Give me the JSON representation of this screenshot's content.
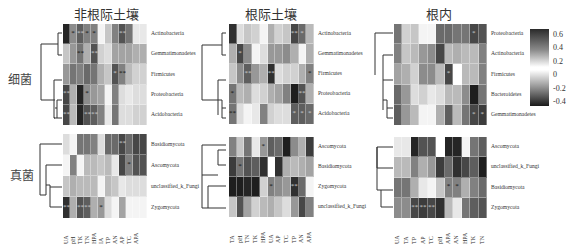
{
  "groups": {
    "bacteria": "细菌",
    "fungi": "真菌"
  },
  "colorbar": {
    "ticks": [
      "0.6",
      "0.4",
      "0.2",
      "0",
      "-0.2",
      "-0.4"
    ],
    "upper_range": [
      0.2,
      0.6
    ],
    "lower_range": [
      -0.4,
      0
    ],
    "colors": {
      "dark": "#1a1a1a",
      "light": "#ffffff"
    }
  },
  "chart_data": {
    "type": "heatmap",
    "title": "",
    "value_scale": "grayscale darkness 0 (white) to 1 (black); legend ranges -0.4..0.6",
    "panels": [
      {
        "title": "非根际土壤",
        "columns": [
          "UA",
          "pH",
          "TK",
          "TN",
          "HPA",
          "IA",
          "TP",
          "AN",
          "AP",
          "TC",
          "APA",
          ""
        ],
        "bacteria_rows": [
          "Actinobacteria",
          "Gemmatimonadetes",
          "Firmicutes",
          "Proteobacteria",
          "Acidobacteria"
        ],
        "bacteria_values": [
          [
            0.95,
            0.5,
            0.7,
            0.55,
            0.55,
            0.05,
            0.25,
            0.55,
            0.75,
            0.6,
            0.1,
            0.1
          ],
          [
            0.25,
            0.45,
            0.6,
            0.35,
            0.75,
            0.2,
            0.15,
            0.4,
            0.4,
            0.4,
            0.35,
            0.35
          ],
          [
            0.45,
            0.6,
            0.55,
            0.65,
            0.6,
            0.35,
            0.25,
            0.75,
            0.55,
            0.3,
            0.2,
            0.2
          ],
          [
            0.8,
            0.35,
            0.95,
            0.5,
            0.45,
            0.4,
            0.05,
            0.55,
            0.15,
            0.1,
            0.15,
            0.15
          ],
          [
            0.8,
            0.3,
            0.95,
            0.75,
            0.7,
            0.55,
            0.1,
            0.6,
            0.15,
            0.15,
            0.2,
            0.2
          ]
        ],
        "bacteria_sig": [
          [
            "",
            "*",
            "***",
            "*",
            "*",
            "",
            "",
            "",
            "**",
            "",
            "",
            ""
          ],
          [
            "",
            "",
            "**",
            "",
            "**",
            "",
            "",
            "",
            "",
            "",
            "",
            ""
          ],
          [
            "",
            "",
            "",
            "",
            "",
            "",
            "",
            "*",
            "**",
            "",
            "",
            ""
          ],
          [
            "**",
            "",
            "",
            "*",
            "",
            "",
            "",
            "",
            "",
            "",
            "",
            ""
          ],
          [
            "**",
            "",
            "",
            "**",
            "**",
            "",
            "",
            "",
            "",
            "",
            "",
            ""
          ]
        ],
        "fungi_rows": [
          "Basidiomycota",
          "Ascomycota",
          "unclassified_k_Fungi",
          "Zygomycota"
        ],
        "fungi_values": [
          [
            0.15,
            0.05,
            0.6,
            0.6,
            0.55,
            0.15,
            0.65,
            0.65,
            0.8,
            0.65,
            0.8,
            0.8
          ],
          [
            0.05,
            0.55,
            0.05,
            0.3,
            0.3,
            0.25,
            0.3,
            0.1,
            0.8,
            0.55,
            0.75,
            0.75
          ],
          [
            0.25,
            0.35,
            0.3,
            0.3,
            0.3,
            0.05,
            0.3,
            0.25,
            0.1,
            0.15,
            0.15,
            0.15
          ],
          [
            0.9,
            0.35,
            0.75,
            0.7,
            0.35,
            0.45,
            0.15,
            0.05,
            0.4,
            0.05,
            0.05,
            0.05
          ]
        ],
        "fungi_sig": [
          [
            "",
            "",
            "",
            "",
            "",
            "",
            "",
            "",
            "**",
            "",
            "",
            ""
          ],
          [
            "",
            "",
            "",
            "",
            "",
            "",
            "",
            "",
            "",
            "*",
            "",
            ""
          ],
          [
            "",
            "",
            "",
            "",
            "",
            "",
            "",
            "",
            "",
            "",
            "",
            ""
          ],
          [
            "**",
            "",
            "***",
            "***",
            "",
            "*",
            "",
            "",
            "",
            "",
            "",
            ""
          ]
        ]
      },
      {
        "title": "根际土壤",
        "columns": [
          "TA",
          "pH",
          "TN",
          "TK",
          "HPA",
          "UA",
          "AP",
          "TC",
          "TP",
          "AN",
          "APA"
        ],
        "bacteria_rows": [
          "Actinobacteria",
          "Gemmatimonadetes",
          "Firmicutes",
          "Proteobacteria",
          "Acidobacteria"
        ],
        "bacteria_values": [
          [
            0.9,
            0.15,
            0.25,
            0.2,
            0.05,
            0.35,
            0.2,
            0.25,
            0.8,
            0.65,
            0.3
          ],
          [
            0.35,
            0.8,
            0.5,
            0.05,
            0.15,
            0.45,
            0.45,
            0.5,
            0.35,
            0.05,
            0.35
          ],
          [
            0.25,
            0.5,
            0.7,
            0.45,
            0.35,
            0.9,
            0.15,
            0.2,
            0.2,
            0.35,
            0.55
          ],
          [
            0.6,
            0.3,
            0.35,
            0.15,
            0.2,
            0.35,
            0.4,
            0.55,
            0.98,
            0.75,
            0.35
          ],
          [
            0.6,
            0.15,
            0.05,
            0.1,
            0.55,
            0.2,
            0.15,
            0.15,
            0.7,
            0.7,
            0.65
          ]
        ],
        "bacteria_sig": [
          [
            "",
            "",
            "",
            "",
            "",
            "",
            "",
            "",
            "**",
            "*",
            ""
          ],
          [
            "",
            "*",
            "",
            "",
            "",
            "",
            "",
            "",
            "",
            "",
            ""
          ],
          [
            "",
            "",
            "**",
            "",
            "",
            "**",
            "",
            "",
            "",
            "",
            "*"
          ],
          [
            "*",
            "",
            "",
            "",
            "",
            "",
            "",
            "",
            "",
            "**",
            ""
          ],
          [
            "**",
            "",
            "",
            "",
            "",
            "",
            "",
            "",
            "*",
            "*",
            "*"
          ]
        ],
        "fungi_rows": [
          "Ascomycota",
          "Basidiomycota",
          "Zygomycota",
          "unclassified_k_Fungi"
        ],
        "fungi_values": [
          [
            0.55,
            0.25,
            0.6,
            0.1,
            0.45,
            0.7,
            0.65,
            0.98,
            0.5,
            0.35,
            0.85
          ],
          [
            0.85,
            0.6,
            0.75,
            0.7,
            0.9,
            0.0,
            0.9,
            0.35,
            0.3,
            0.35,
            0.4
          ],
          [
            0.98,
            0.98,
            0.95,
            0.98,
            0.2,
            0.55,
            0.5,
            0.45,
            0.9,
            0.65,
            0.05
          ],
          [
            0.25,
            0.75,
            0.4,
            0.2,
            0.3,
            0.35,
            0.25,
            0.15,
            0.45,
            0.8,
            0.55
          ]
        ],
        "fungi_sig": [
          [
            "",
            "",
            "",
            "",
            "*",
            "",
            "",
            "",
            "",
            "",
            ""
          ],
          [
            "",
            "*",
            "",
            "",
            "",
            "",
            "",
            "",
            "",
            "",
            ""
          ],
          [
            "",
            "",
            "",
            "",
            "",
            "*",
            "",
            "",
            "**",
            "",
            ""
          ],
          [
            "",
            "",
            "",
            "",
            "",
            "",
            "",
            "",
            "",
            "",
            ""
          ]
        ]
      },
      {
        "title": "根内",
        "columns": [
          "UA",
          "TA",
          "TP",
          "AP",
          "TC",
          "pH",
          "APA",
          "AN",
          "HPA",
          "TK",
          "TN"
        ],
        "bacteria_rows": [
          "Proteobacteria",
          "Actinobacteria",
          "Firmicutes",
          "Bacteroidetes",
          "Gemmatimonadetes"
        ],
        "bacteria_values": [
          [
            0.6,
            0.2,
            0.25,
            0.05,
            0.05,
            0.65,
            0.65,
            0.6,
            0.6,
            0.8,
            0.75
          ],
          [
            0.55,
            0.25,
            0.3,
            0.45,
            0.5,
            0.8,
            0.3,
            0.35,
            0.3,
            0.3,
            0.55
          ],
          [
            0.4,
            0.35,
            0.2,
            0.5,
            0.5,
            0.3,
            0.8,
            0.0,
            0.3,
            0.3,
            0.55
          ],
          [
            0.65,
            0.45,
            0.15,
            0.2,
            0.1,
            0.15,
            0.3,
            0.3,
            0.5,
            0.98,
            0.6
          ],
          [
            0.7,
            0.45,
            0.3,
            0.05,
            0.05,
            0.35,
            0.7,
            0.3,
            0.6,
            0.8,
            0.85
          ]
        ],
        "bacteria_sig": [
          [
            "",
            "",
            "",
            "",
            "",
            "",
            "",
            "",
            "",
            "*",
            ""
          ],
          [
            "",
            "",
            "",
            "",
            "",
            "",
            "",
            "",
            "",
            "",
            ""
          ],
          [
            "",
            "",
            "",
            "",
            "",
            "",
            "*",
            "",
            "",
            "",
            ""
          ],
          [
            "",
            "",
            "",
            "",
            "",
            "",
            "",
            "",
            "",
            "",
            ""
          ],
          [
            "",
            "",
            "",
            "",
            "",
            "",
            "",
            "",
            "",
            "*",
            "*"
          ]
        ],
        "fungi_rows": [
          "Ascomycota",
          "unclassified_k_Fungi",
          "Basidiomycota",
          "Zygomycota"
        ],
        "fungi_values": [
          [
            0.1,
            0.1,
            0.95,
            0.75,
            0.75,
            0.0,
            0.95,
            0.95,
            0.05,
            0.6,
            0.7
          ],
          [
            0.3,
            0.3,
            0.55,
            0.35,
            0.45,
            0.85,
            0.65,
            0.9,
            0.8,
            0.7,
            0.98
          ],
          [
            0.6,
            0.6,
            0.35,
            0.1,
            0.05,
            0.25,
            0.55,
            0.55,
            0.35,
            0.55,
            0.65
          ],
          [
            0.5,
            0.5,
            0.8,
            0.85,
            0.8,
            0.9,
            0.3,
            0.1,
            0.6,
            0.7,
            0.75
          ]
        ],
        "fungi_sig": [
          [
            "",
            "",
            "",
            "",
            "",
            "",
            "",
            "",
            "",
            "",
            ""
          ],
          [
            "",
            "",
            "",
            "",
            "",
            "",
            "",
            "",
            "",
            "",
            ""
          ],
          [
            "",
            "",
            "",
            "",
            "",
            "",
            "*",
            "*",
            "",
            "",
            ""
          ],
          [
            "",
            "",
            "**",
            "**",
            "**",
            "",
            "",
            "",
            "",
            "",
            ""
          ]
        ]
      }
    ]
  }
}
